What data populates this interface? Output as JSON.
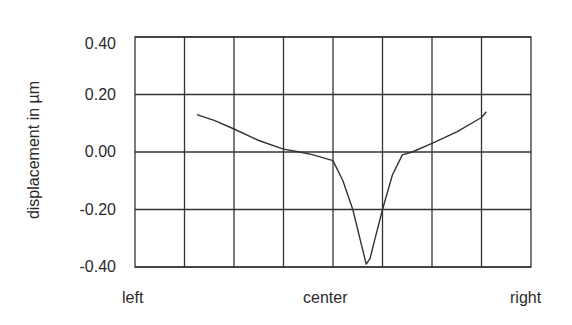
{
  "chart_data": {
    "type": "line",
    "title": "",
    "xlabel": "",
    "ylabel": "displacement  in  µm",
    "x_tick_labels": [
      "left",
      "center",
      "right"
    ],
    "y_ticks": [
      "0.40",
      "0.20",
      "0.00",
      "-0.20",
      "-0.40"
    ],
    "ylim": [
      -0.4,
      0.4
    ],
    "xlim": [
      0,
      8
    ],
    "grid": true,
    "grid_columns": 8,
    "series": [
      {
        "name": "displacement",
        "x": [
          1.25,
          1.6,
          2.0,
          2.5,
          3.0,
          3.33,
          3.6,
          4.0,
          4.2,
          4.4,
          4.6,
          4.67,
          4.75,
          4.85,
          5.0,
          5.2,
          5.4,
          5.6,
          6.0,
          6.5,
          7.0,
          7.1
        ],
        "y": [
          0.13,
          0.11,
          0.08,
          0.04,
          0.01,
          0.0,
          -0.01,
          -0.03,
          -0.1,
          -0.2,
          -0.34,
          -0.39,
          -0.37,
          -0.3,
          -0.2,
          -0.08,
          -0.01,
          0.0,
          0.03,
          0.07,
          0.12,
          0.14
        ]
      }
    ]
  }
}
